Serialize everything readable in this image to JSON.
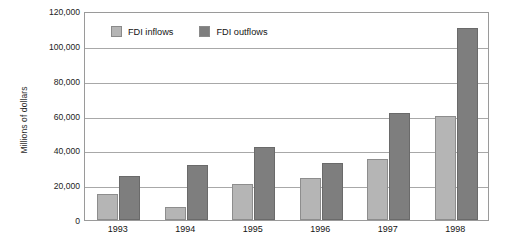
{
  "chart_data": {
    "type": "bar",
    "title": "",
    "xlabel": "",
    "ylabel": "Millions of dollars",
    "ylim": [
      0,
      120000
    ],
    "ytick_step": 20000,
    "yticks": [
      "0",
      "20,000",
      "40,000",
      "60,000",
      "80,000",
      "100,000",
      "120,000"
    ],
    "ytick_values": [
      0,
      20000,
      40000,
      60000,
      80000,
      100000,
      120000
    ],
    "grid": "horizontal",
    "legend_position": "top-left-inside",
    "categories": [
      "1993",
      "1994",
      "1995",
      "1996",
      "1997",
      "1998"
    ],
    "series": [
      {
        "name": "FDI inflows",
        "color": "#b5b5b5",
        "values": [
          15000,
          7500,
          20500,
          24000,
          35000,
          60000
        ]
      },
      {
        "name": "FDI outflows",
        "color": "#7e7e7e",
        "values": [
          25000,
          31500,
          42000,
          33000,
          61500,
          110500
        ]
      }
    ]
  },
  "legend": {
    "items": [
      {
        "label": "FDI inflows",
        "swatch": "inflow"
      },
      {
        "label": "FDI outflows",
        "swatch": "outflow"
      }
    ]
  },
  "caption": {
    "source": ""
  }
}
